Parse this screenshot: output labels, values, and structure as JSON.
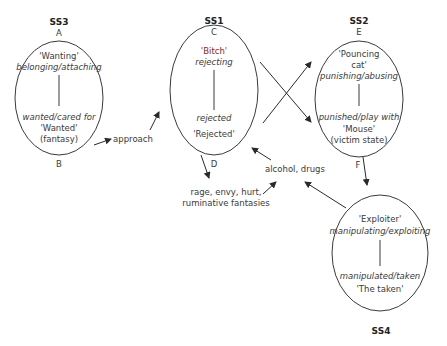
{
  "diagram": {
    "states": [
      {
        "id": "SS3",
        "label": "SS3",
        "top_letter": "A",
        "bottom_letter": "B",
        "top_role": "'Wanting'",
        "top_verb": "belonging/attaching",
        "bottom_verb": "wanted/cared for",
        "bottom_role": "'Wanted'",
        "bottom_note": "(fantasy)"
      },
      {
        "id": "SS1",
        "label": "SS1",
        "top_letter": "C",
        "bottom_letter": "D",
        "top_role": "'Bitch'",
        "top_verb": "rejecting",
        "bottom_verb": "rejected",
        "bottom_role": "'Rejected'"
      },
      {
        "id": "SS2",
        "label": "SS2",
        "top_letter": "E",
        "bottom_letter": "F",
        "top_role_line1": "'Pouncing",
        "top_role_line2": "cat'",
        "top_verb": "punishing/abusing",
        "bottom_verb": "punished/play with",
        "bottom_role": "'Mouse'",
        "bottom_note": "(victim state)"
      },
      {
        "id": "SS4",
        "label": "SS4",
        "top_role": "'Exploiter'",
        "top_verb": "manipulating/exploiting",
        "bottom_verb": "manipulated/taken",
        "bottom_role": "'The taken'"
      }
    ],
    "annotations": {
      "approach": "approach",
      "rage_line1": "rage, envy, hurt,",
      "rage_line2": "ruminative fantasies",
      "alcohol": "alcohol, drugs"
    },
    "colors": {
      "line": "#3a3a3a",
      "accent_text": "#8b2a1a",
      "background": "#ffffff"
    }
  }
}
